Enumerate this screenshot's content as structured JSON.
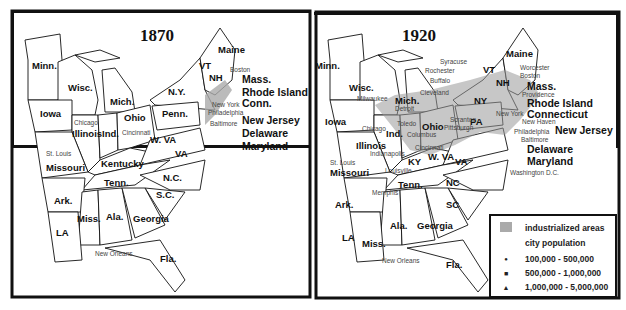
{
  "maps": [
    {
      "title": "1870",
      "states": [
        "Minn.",
        "Wisc.",
        "Mich.",
        "Iowa",
        "Illinois",
        "Ind.",
        "Ohio",
        "N.Y.",
        "Penn.",
        "Maine",
        "VT",
        "NH",
        "Mass.",
        "Rhode Island",
        "Conn.",
        "New Jersey",
        "Delaware",
        "Maryland",
        "W. VA",
        "VA",
        "Kentucky",
        "Missouri",
        "Tenn.",
        "N.C.",
        "S.C.",
        "Ark.",
        "Miss.",
        "Ala.",
        "Georgia",
        "LA",
        "Fla."
      ],
      "cities": [
        "Boston",
        "New York",
        "Philadelphia",
        "Baltimore",
        "Chicago",
        "Cincinnati",
        "St. Louis",
        "New Orleans"
      ]
    },
    {
      "title": "1920",
      "states": [
        "Minn.",
        "Wisc.",
        "Mich.",
        "Iowa",
        "Illinois",
        "Ind.",
        "Ohio",
        "NY",
        "PA",
        "Maine",
        "VT",
        "NH",
        "Mass.",
        "Rhode Island",
        "Connecticut",
        "New Jersey",
        "Delaware",
        "Maryland",
        "W. VA",
        "VA",
        "KY",
        "Missouri",
        "Tenn.",
        "NC",
        "SC",
        "Ark.",
        "Miss.",
        "Ala.",
        "Georgia",
        "LA",
        "Fla."
      ],
      "cities": [
        "Syracuse",
        "Rochester",
        "Buffalo",
        "Cleveland",
        "Milwaukee",
        "Detroit",
        "Toledo",
        "Chicago",
        "Columbus",
        "Scranton",
        "Pittsburgh",
        "Cincinnati",
        "Indianapolis",
        "Louisville",
        "St. Louis",
        "Memphis",
        "New Orleans",
        "Worcester",
        "Boston",
        "Providence",
        "New York",
        "New Haven",
        "Philadelphia",
        "Baltimore",
        "Washington D.C."
      ]
    }
  ],
  "legend": {
    "industrialized": "industrialized areas",
    "city_population": "city population",
    "items": [
      {
        "symbol": "●",
        "label": "100,000 - 500,000"
      },
      {
        "symbol": "■",
        "label": "500,000 - 1,000,000"
      },
      {
        "symbol": "▲",
        "label": "1,000,000 - 5,000,000"
      }
    ]
  },
  "colors": {
    "industrialized": "#aaaaaa",
    "border": "#111111"
  }
}
